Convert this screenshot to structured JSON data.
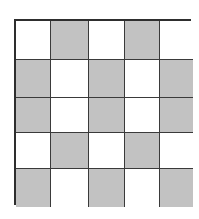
{
  "figure": {
    "type": "checkerboard-grid",
    "rows": 5,
    "cols": 5,
    "colors": {
      "gray": "#c2c2c2",
      "white": "#ffffff",
      "line": "#3a3a3a",
      "border": "#2e2e2e"
    },
    "col_edges": [
      0,
      35,
      73,
      109,
      144,
      177
    ],
    "row_edges": [
      0,
      39,
      77,
      112,
      148,
      186
    ],
    "pattern": [
      [
        "white",
        "gray",
        "white",
        "gray",
        "white"
      ],
      [
        "gray",
        "white",
        "gray",
        "white",
        "gray"
      ],
      [
        "gray",
        "white",
        "gray",
        "white",
        "gray"
      ],
      [
        "white",
        "gray",
        "white",
        "gray",
        "white"
      ],
      [
        "gray",
        "white",
        "gray",
        "white",
        "gray"
      ]
    ]
  }
}
